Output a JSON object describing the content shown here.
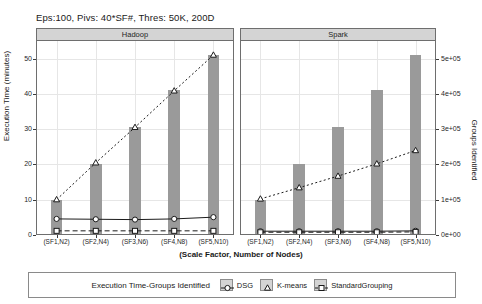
{
  "chart_data": {
    "type": "bar",
    "title": "Eps:100, Pivs: 40*SF#, Thres: 50K, 200D",
    "xlabel": "(Scale Factor, Number of Nodes)",
    "ylabel": "Execution Time (minutes)",
    "ylabel_right": "Groups Identified",
    "categories": [
      "(SF1,N2)",
      "(SF2,N4)",
      "(SF3,N6)",
      "(SF4,N8)",
      "(SF5,N10)"
    ],
    "yticks_left": [
      "0",
      "10",
      "20",
      "30",
      "40",
      "50"
    ],
    "ytick_values_left": [
      0,
      10,
      20,
      30,
      40,
      50
    ],
    "ylim_left": [
      0,
      55
    ],
    "yticks_right": [
      "0e+00",
      "1e+05",
      "2e+05",
      "3e+05",
      "4e+05",
      "5e+05"
    ],
    "ytick_values_right": [
      0,
      100000,
      200000,
      300000,
      400000,
      500000
    ],
    "ylim_right": [
      0,
      550000
    ],
    "grid": true,
    "legend_position": "bottom",
    "panels": [
      {
        "name": "Hadoop",
        "bars": {
          "name": "Groups Identified",
          "axis": "right",
          "values": [
            100000,
            200000,
            305000,
            410000,
            510000
          ]
        },
        "series": [
          {
            "name": "K-means",
            "marker": "triangle",
            "line": "dotted",
            "axis": "left",
            "values": [
              9.8,
              20.3,
              30.4,
              40.8,
              51.0
            ]
          },
          {
            "name": "DSG",
            "marker": "circle",
            "line": "solid",
            "axis": "left",
            "values": [
              4.3,
              4.2,
              4.1,
              4.3,
              4.8
            ]
          },
          {
            "name": "StandardGrouping",
            "marker": "square",
            "line": "dashed",
            "axis": "left",
            "values": [
              0.9,
              0.9,
              0.9,
              0.9,
              0.9
            ]
          }
        ]
      },
      {
        "name": "Spark",
        "bars": {
          "name": "Groups Identified",
          "axis": "right",
          "values": [
            100000,
            200000,
            305000,
            410000,
            510000
          ]
        },
        "series": [
          {
            "name": "K-means",
            "marker": "triangle",
            "line": "dotted",
            "axis": "left",
            "values": [
              10.0,
              13.2,
              16.5,
              20.0,
              23.8
            ]
          },
          {
            "name": "DSG",
            "marker": "circle",
            "line": "solid",
            "axis": "left",
            "values": [
              0.8,
              0.8,
              0.8,
              0.8,
              0.9
            ]
          },
          {
            "name": "StandardGrouping",
            "marker": "square",
            "line": "dashed",
            "axis": "left",
            "values": [
              0.5,
              0.5,
              0.5,
              0.5,
              0.6
            ]
          }
        ]
      }
    ],
    "legend": {
      "title": "Execution Time-Groups Identified",
      "entries": [
        {
          "label": "DSG",
          "marker": "circle"
        },
        {
          "label": "K-means",
          "marker": "triangle"
        },
        {
          "label": "StandardGrouping",
          "marker": "square"
        }
      ]
    },
    "colors": {
      "bar": "#9a9a9a",
      "line": "#1a1a1a",
      "strip": "#d4d4d4",
      "grid": "#e6e6e6",
      "frame": "#6e6e6e"
    }
  }
}
